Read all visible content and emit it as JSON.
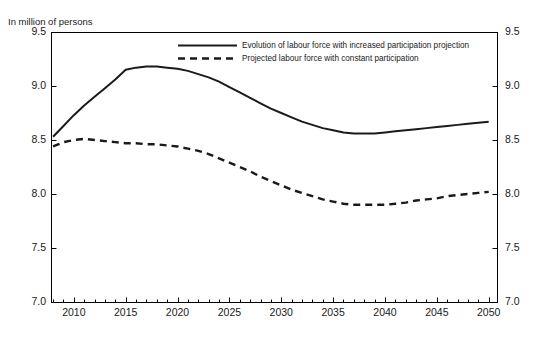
{
  "chart_data": {
    "type": "line",
    "title": "",
    "subtitle": "",
    "unit_label": "In million of persons",
    "xlabel": "",
    "ylabel": "",
    "xlim": [
      2007.8,
      2050.8
    ],
    "ylim": [
      7.0,
      9.5
    ],
    "grid": false,
    "legend_position": "top-center",
    "y_ticks": [
      "9.5",
      "9.0",
      "8.5",
      "8.0",
      "7.5",
      "7.0"
    ],
    "y_tick_values": [
      9.5,
      9.0,
      8.5,
      8.0,
      7.5,
      7.0
    ],
    "y_ticks_right": [
      "9.5",
      "9.0",
      "8.5",
      "8.0",
      "7.5",
      "7.0"
    ],
    "x_ticks": [
      "2010",
      "2015",
      "2020",
      "2025",
      "2030",
      "2035",
      "2040",
      "2045",
      "2050"
    ],
    "x_tick_values": [
      2010,
      2015,
      2020,
      2025,
      2030,
      2035,
      2040,
      2045,
      2050
    ],
    "x_minor_tick_step": 1,
    "series": [
      {
        "name": "Evolution of labour force with increased participation projection",
        "style": "solid",
        "color": "#1a1a1a",
        "x": [
          2008,
          2009,
          2010,
          2011,
          2012,
          2013,
          2014,
          2015,
          2016,
          2017,
          2018,
          2019,
          2020,
          2021,
          2022,
          2023,
          2024,
          2025,
          2026,
          2027,
          2028,
          2029,
          2030,
          2031,
          2032,
          2033,
          2034,
          2035,
          2036,
          2037,
          2038,
          2039,
          2040,
          2041,
          2042,
          2043,
          2044,
          2045,
          2046,
          2047,
          2048,
          2049,
          2050
        ],
        "values": [
          8.53,
          8.63,
          8.73,
          8.82,
          8.9,
          8.98,
          9.06,
          9.15,
          9.17,
          9.18,
          9.18,
          9.17,
          9.16,
          9.14,
          9.11,
          9.08,
          9.04,
          8.99,
          8.94,
          8.89,
          8.84,
          8.79,
          8.75,
          8.71,
          8.67,
          8.64,
          8.61,
          8.59,
          8.57,
          8.56,
          8.56,
          8.56,
          8.57,
          8.58,
          8.59,
          8.6,
          8.61,
          8.62,
          8.63,
          8.64,
          8.65,
          8.66,
          8.67
        ]
      },
      {
        "name": "Projected labour force with constant participation",
        "style": "dashed",
        "color": "#1a1a1a",
        "x": [
          2008,
          2009,
          2010,
          2011,
          2012,
          2013,
          2014,
          2015,
          2016,
          2017,
          2018,
          2019,
          2020,
          2021,
          2022,
          2023,
          2024,
          2025,
          2026,
          2027,
          2028,
          2029,
          2030,
          2031,
          2032,
          2033,
          2034,
          2035,
          2036,
          2037,
          2038,
          2039,
          2040,
          2041,
          2042,
          2043,
          2044,
          2045,
          2046,
          2047,
          2048,
          2049,
          2050
        ],
        "values": [
          8.44,
          8.48,
          8.5,
          8.51,
          8.5,
          8.49,
          8.48,
          8.47,
          8.47,
          8.46,
          8.46,
          8.45,
          8.44,
          8.42,
          8.4,
          8.37,
          8.33,
          8.29,
          8.25,
          8.21,
          8.16,
          8.12,
          8.08,
          8.04,
          8.01,
          7.98,
          7.95,
          7.93,
          7.91,
          7.9,
          7.9,
          7.9,
          7.9,
          7.91,
          7.92,
          7.94,
          7.95,
          7.96,
          7.98,
          7.99,
          8.0,
          8.01,
          8.02
        ]
      }
    ],
    "legend": [
      {
        "label": "Evolution of labour force with increased participation projection",
        "style": "solid"
      },
      {
        "label": "Projected labour force with constant participation",
        "style": "dashed"
      }
    ]
  },
  "source_note": "",
  "plot_frame": {
    "left": 51,
    "right": 497,
    "top": 32,
    "bottom": 302
  }
}
